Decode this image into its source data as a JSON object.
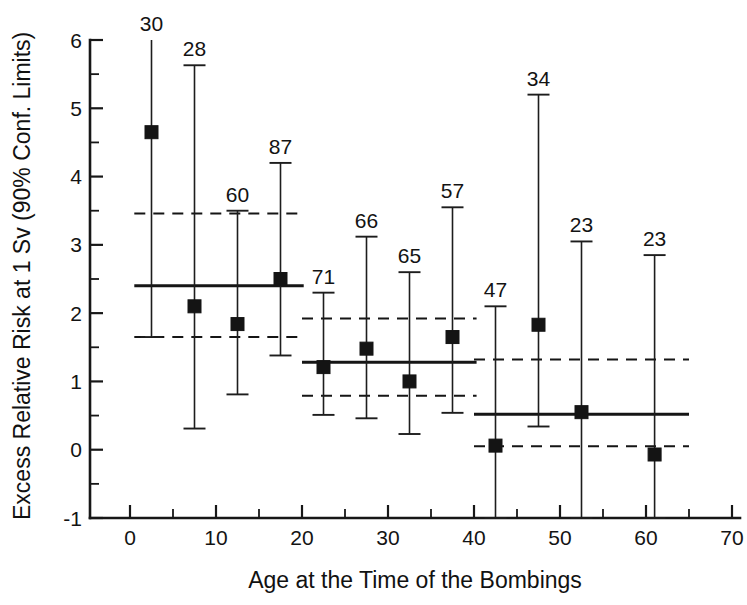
{
  "chart_data": {
    "type": "scatter",
    "title": "",
    "xlabel": "Age at the Time of the Bombings",
    "ylabel": "Excess Relative Risk at 1 Sv (90% Conf. Limits)",
    "xlim": [
      -5,
      70
    ],
    "ylim": [
      -1,
      6
    ],
    "xticks": [
      0,
      10,
      20,
      30,
      40,
      50,
      60,
      70
    ],
    "xticklabels": [
      "0",
      "10",
      "20",
      "30",
      "40",
      "50",
      "60",
      "70"
    ],
    "xminorticks": [
      5,
      15,
      25,
      35,
      45,
      55,
      65
    ],
    "yticks": [
      -1,
      0,
      1,
      2,
      3,
      4,
      5,
      6
    ],
    "yticklabels": [
      "-1",
      "0",
      "1",
      "2",
      "3",
      "4",
      "5",
      "6"
    ],
    "yminorticks": [
      -0.5,
      0.5,
      1.5,
      2.5,
      3.5,
      4.5,
      5.5
    ],
    "grid": false,
    "legend": "none",
    "marker_style": "filled-square",
    "error_bar_style": "90% confidence limits with caps",
    "points": [
      {
        "x": 2.5,
        "y": 4.65,
        "lower": 1.65,
        "upper": 6.05,
        "count": "30",
        "upper_clipped": true
      },
      {
        "x": 7.5,
        "y": 2.1,
        "lower": 0.31,
        "upper": 5.63,
        "count": "28",
        "upper_clipped": false
      },
      {
        "x": 12.5,
        "y": 1.84,
        "lower": 0.81,
        "upper": 3.5,
        "count": "60",
        "upper_clipped": false
      },
      {
        "x": 17.5,
        "y": 2.5,
        "lower": 1.38,
        "upper": 4.2,
        "count": "87",
        "upper_clipped": false
      },
      {
        "x": 22.5,
        "y": 1.21,
        "lower": 0.51,
        "upper": 2.3,
        "count": "71",
        "upper_clipped": false
      },
      {
        "x": 27.5,
        "y": 1.48,
        "lower": 0.46,
        "upper": 3.12,
        "count": "66",
        "upper_clipped": false
      },
      {
        "x": 32.5,
        "y": 1.0,
        "lower": 0.23,
        "upper": 2.6,
        "count": "65",
        "upper_clipped": false
      },
      {
        "x": 37.5,
        "y": 1.65,
        "lower": 0.54,
        "upper": 3.55,
        "count": "57",
        "upper_clipped": false
      },
      {
        "x": 42.5,
        "y": 0.06,
        "lower": -1.0,
        "upper": 2.1,
        "count": "47",
        "upper_clipped": false
      },
      {
        "x": 47.5,
        "y": 1.83,
        "lower": 0.34,
        "upper": 5.2,
        "count": "34",
        "upper_clipped": false
      },
      {
        "x": 52.5,
        "y": 0.55,
        "lower": -1.0,
        "upper": 3.05,
        "count": "23",
        "upper_clipped": false
      },
      {
        "x": 61.0,
        "y": -0.07,
        "lower": -1.0,
        "upper": 2.85,
        "count": "23",
        "upper_clipped": false
      }
    ],
    "group_fits": [
      {
        "name": "age-0-20",
        "x_start": 0.5,
        "x_end": 20.2,
        "estimate": 2.4,
        "ci_lower": 1.65,
        "ci_upper": 3.46
      },
      {
        "name": "age-20-40",
        "x_start": 20.0,
        "x_end": 40.3,
        "estimate": 1.28,
        "ci_lower": 0.79,
        "ci_upper": 1.92
      },
      {
        "name": "age-40-65",
        "x_start": 40.0,
        "x_end": 65.0,
        "estimate": 0.52,
        "ci_lower": 0.05,
        "ci_upper": 1.32
      }
    ]
  },
  "axes": {
    "y_axis_title": "Excess Relative Risk at 1 Sv (90% Conf. Limits)",
    "x_axis_title": "Age at the Time of the Bombings"
  },
  "tick_text": {
    "y": [
      "6",
      "5",
      "4",
      "3",
      "2",
      "1",
      "0",
      "-1"
    ],
    "x": [
      "0",
      "10",
      "20",
      "30",
      "40",
      "50",
      "60",
      "70"
    ]
  },
  "colors": {
    "ink": "#151515",
    "background": "#ffffff"
  }
}
